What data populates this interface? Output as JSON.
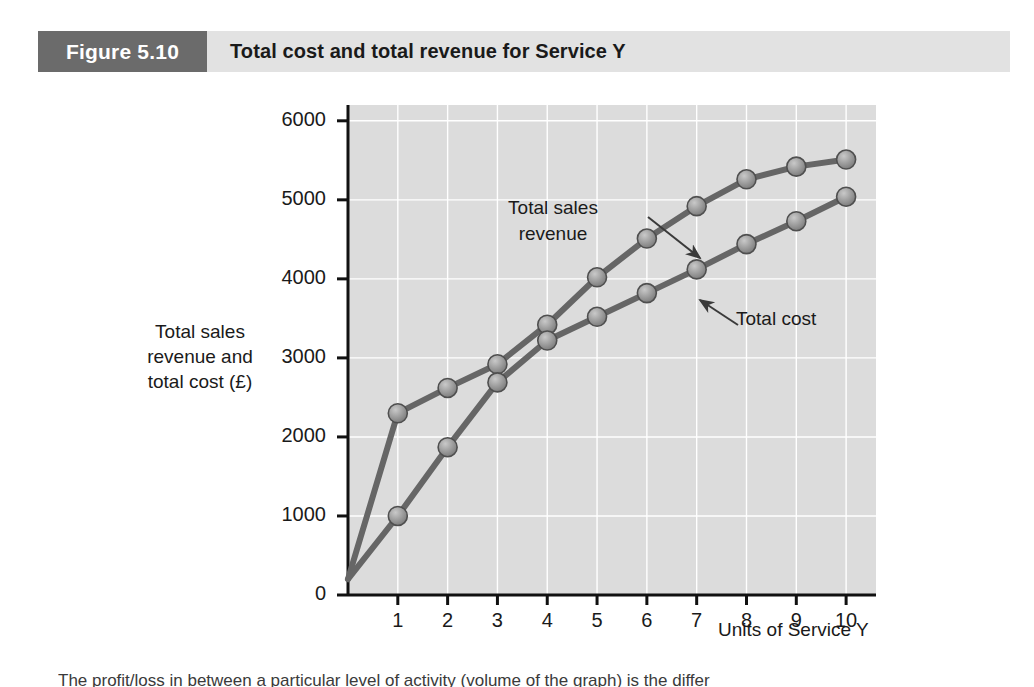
{
  "header": {
    "figure_number": "Figure 5.10",
    "title": "Total cost and total revenue for Service Y",
    "number_box_color": "#6b6b6b",
    "title_bar_color": "#e2e2e2"
  },
  "body_text_fragment": "The profit/loss in between a particular level of activity (volume of the graph) is the differ",
  "chart_data": {
    "type": "line",
    "title": "Total cost and total revenue for Service Y",
    "xlabel": "Units of Service Y",
    "ylabel": "Total sales\nrevenue and\ntotal cost (£)",
    "x": [
      0,
      1,
      2,
      3,
      4,
      5,
      6,
      7,
      8,
      9,
      10
    ],
    "xticks": [
      1,
      2,
      3,
      4,
      5,
      6,
      7,
      8,
      9,
      10
    ],
    "yticks": [
      0,
      1000,
      2000,
      3000,
      4000,
      5000,
      6000
    ],
    "xlim": [
      0,
      10.6
    ],
    "ylim": [
      0,
      6200
    ],
    "grid": true,
    "legend": "annotations",
    "plot_background": "#dcdcdc",
    "series": [
      {
        "name": "Total sales revenue",
        "color": "#666666",
        "marker_color": "#9a9a9a",
        "x": [
          0,
          1,
          2,
          3,
          4,
          5,
          6,
          7,
          8,
          9,
          10
        ],
        "values": [
          200,
          2300,
          2620,
          2920,
          3420,
          4020,
          4510,
          4920,
          5260,
          5420,
          5510
        ]
      },
      {
        "name": "Total cost",
        "color": "#666666",
        "marker_color": "#9a9a9a",
        "x": [
          0,
          1,
          2,
          3,
          4,
          5,
          6,
          7,
          8,
          9,
          10
        ],
        "values": [
          200,
          1000,
          1870,
          2690,
          3220,
          3520,
          3820,
          4120,
          4440,
          4730,
          5040
        ]
      }
    ],
    "annotations": [
      {
        "text": "Total sales\nrevenue",
        "target_x": 6,
        "target_y": 4510
      },
      {
        "text": "Total cost",
        "target_x": 7,
        "target_y": 4120
      }
    ]
  }
}
